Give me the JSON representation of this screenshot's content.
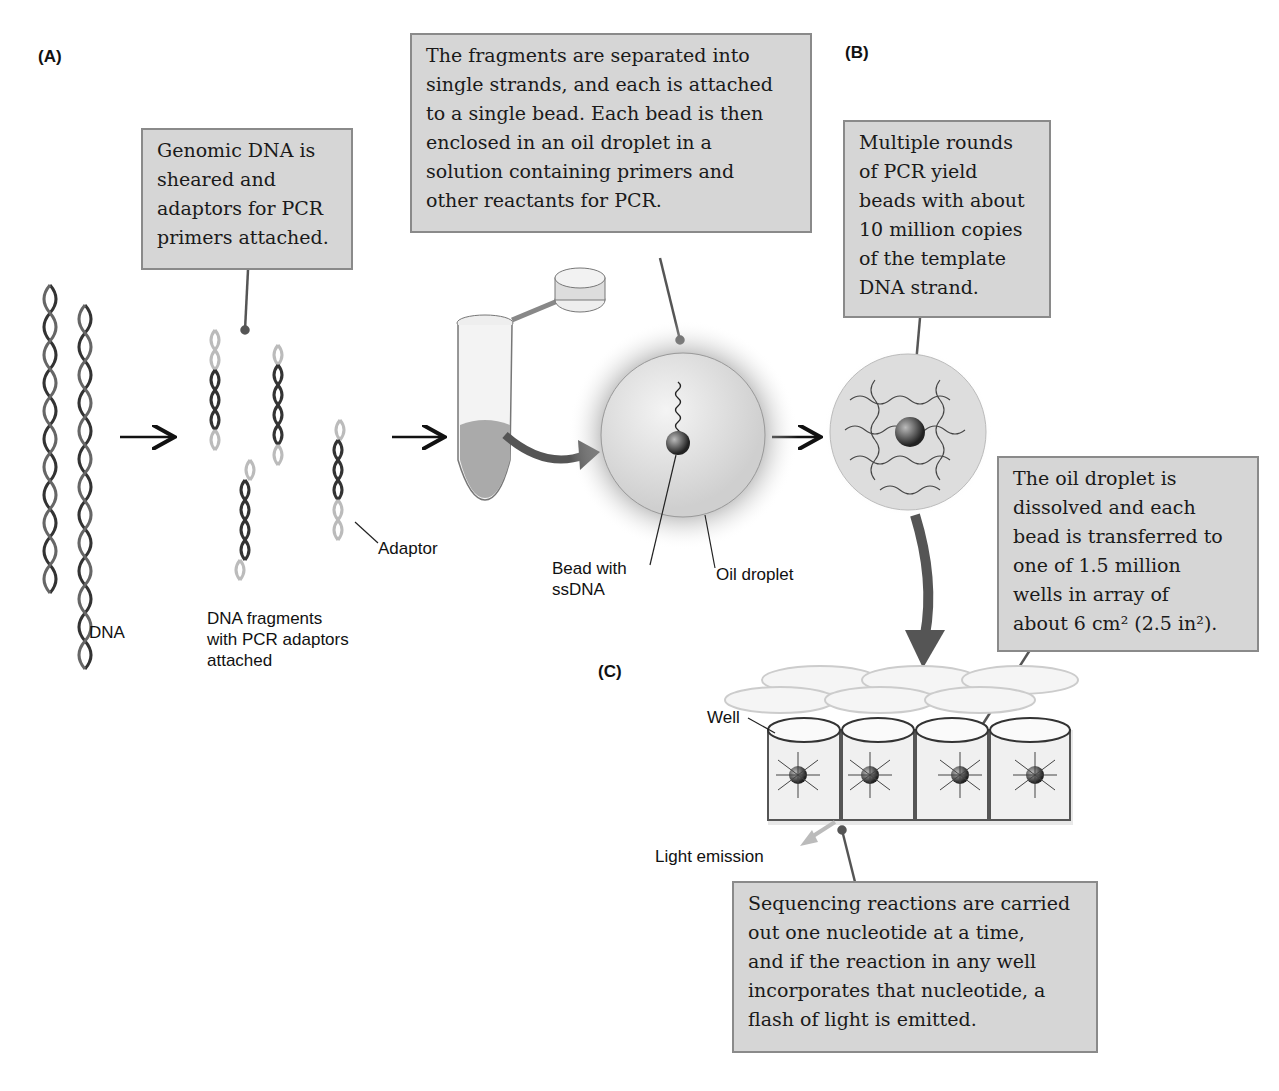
{
  "panels": {
    "a": "(A)",
    "b": "(B)",
    "c": "(C)"
  },
  "callouts": {
    "genomic": [
      "Genomic DNA is",
      "sheared and",
      "adaptors for PCR",
      "primers attached."
    ],
    "fragments": [
      "The fragments are separated into",
      "single strands, and each is attached",
      "to a single bead. Each bead is then",
      "enclosed in an oil droplet in a",
      "solution containing primers and",
      "other reactants for PCR."
    ],
    "pcr": [
      "Multiple rounds",
      "of PCR yield",
      "beads with about",
      "10 million copies",
      "of the template",
      "DNA strand."
    ],
    "oil": [
      "The oil droplet is",
      "dissolved and each",
      "bead is transferred to",
      "one of 1.5 million",
      "wells in array of",
      "about 6 cm² (2.5 in²)."
    ],
    "sequencing": [
      "Sequencing reactions are carried",
      "out one nucleotide at a time,",
      "and if the reaction in any well",
      "incorporates that nucleotide, a",
      "flash of light is emitted."
    ]
  },
  "labels": {
    "dna": "DNA",
    "fragments": [
      "DNA fragments",
      "with PCR adaptors",
      "attached"
    ],
    "adaptor": "Adaptor",
    "bead": [
      "Bead with",
      "ssDNA"
    ],
    "oil_droplet": "Oil droplet",
    "well": "Well",
    "light": "Light emission"
  },
  "colors": {
    "callout_bg": "#d6d6d6",
    "callout_border": "#8a8a8a",
    "arrow": "#5a5a5a"
  }
}
